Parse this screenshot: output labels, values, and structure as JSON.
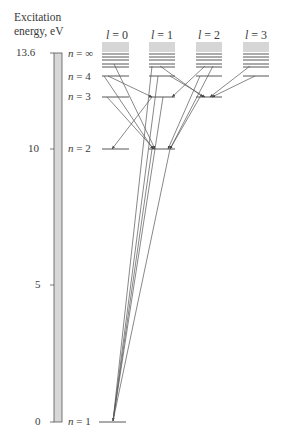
{
  "axis": {
    "title_line1": "Excitation",
    "title_line2": "energy, eV",
    "ticks": [
      {
        "label": "13.6",
        "value": 13.6
      },
      {
        "label": "10",
        "value": 10
      },
      {
        "label": "5",
        "value": 5
      },
      {
        "label": "0",
        "value": 0
      }
    ]
  },
  "columns": [
    {
      "label": "l = 0",
      "l": "l",
      "eq": " = 0"
    },
    {
      "label": "l = 1",
      "l": "l",
      "eq": " = 1"
    },
    {
      "label": "l = 2",
      "l": "l",
      "eq": " = 2"
    },
    {
      "label": "l = 3",
      "l": "l",
      "eq": " = 3"
    }
  ],
  "levels": [
    {
      "n": "n",
      "eq": " = ∞",
      "label": "n = ∞"
    },
    {
      "n": "n",
      "eq": " = 4",
      "label": "n = 4"
    },
    {
      "n": "n",
      "eq": " = 3",
      "label": "n = 3"
    },
    {
      "n": "n",
      "eq": " = 2",
      "label": "n = 2"
    },
    {
      "n": "n",
      "eq": " = 1",
      "label": "n = 1"
    }
  ],
  "colors": {
    "line": "#444444",
    "bar_fill": "#d8d8d8",
    "continuum": "#d6d6d6"
  }
}
